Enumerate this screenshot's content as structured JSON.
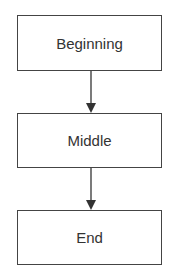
{
  "diagram": {
    "type": "flowchart",
    "nodes": [
      {
        "id": "n1",
        "label": "Beginning"
      },
      {
        "id": "n2",
        "label": "Middle"
      },
      {
        "id": "n3",
        "label": "End"
      }
    ],
    "edges": [
      {
        "from": "n1",
        "to": "n2"
      },
      {
        "from": "n2",
        "to": "n3"
      }
    ],
    "colors": {
      "stroke": "#444444",
      "text": "#333333",
      "background": "#ffffff"
    }
  }
}
